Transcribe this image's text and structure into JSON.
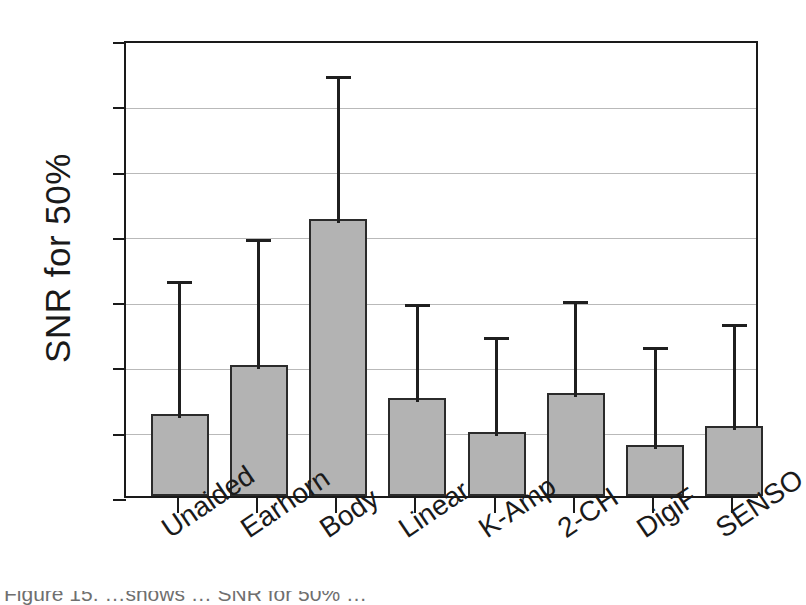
{
  "chart_data": {
    "type": "bar",
    "title": "",
    "xlabel": "",
    "ylabel": "SNR for 50%",
    "categories": [
      "Unaided",
      "Earhorn",
      "Body",
      "Linear",
      "K-Amp",
      "2-CH",
      "DigiF",
      "SENSO"
    ],
    "values": [
      2.5,
      4.0,
      8.5,
      3.0,
      1.95,
      3.15,
      1.55,
      2.15
    ],
    "error_upper": [
      6.7,
      8.0,
      13.0,
      6.0,
      5.0,
      6.1,
      4.7,
      5.4
    ],
    "ylim": [
      0,
      14
    ],
    "ytick_labels": [
      "0",
      "2",
      "4",
      "6",
      "8",
      "10",
      "12",
      "14"
    ],
    "ytick_values": [
      0,
      2,
      4,
      6,
      8,
      10,
      12,
      14
    ],
    "ytick_step": 2,
    "grid": true,
    "legend": "none",
    "bar_color": "#b3b3b3",
    "bar_edge_color": "#2b2b2b",
    "error_bar_color": "#1f1f1f",
    "axis_color": "#1a1a1a",
    "grid_color": "#b9b9b9",
    "background_color": "#ffffff",
    "xtick_label_rotation": -34,
    "error_bar_style": "upper-whisker-only"
  },
  "caption_fragment": "Figure 15. …shows … SNR for 50% …"
}
